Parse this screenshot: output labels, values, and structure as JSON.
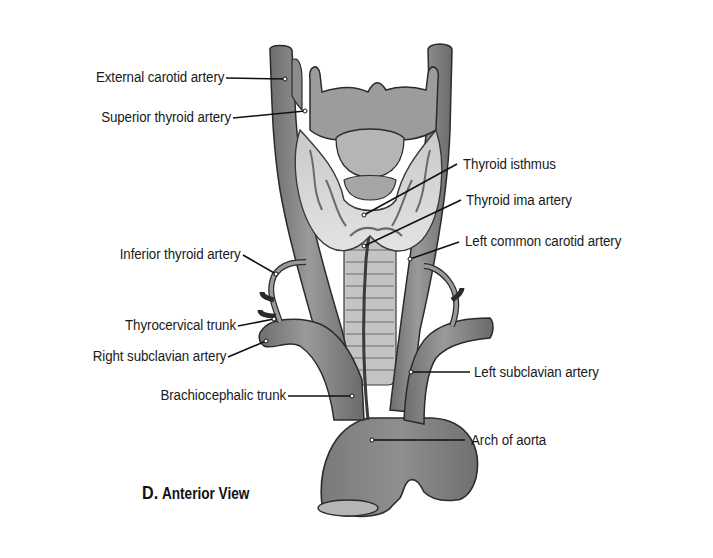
{
  "figure": {
    "panel_letter": "D.",
    "view_title": "Anterior View",
    "colors": {
      "artery": "#8a8a8a",
      "artery_dark": "#5e5e5e",
      "thyroid_gland": "#dcdcdc",
      "cartilage": "#a9a9a9",
      "outline": "#2b2b2b",
      "leader_line": "#111111",
      "background": "#ffffff"
    }
  },
  "labels": {
    "left": [
      {
        "id": "external-carotid-artery",
        "text": "External carotid artery"
      },
      {
        "id": "superior-thyroid-artery",
        "text": "Superior thyroid artery"
      },
      {
        "id": "inferior-thyroid-artery",
        "text": "Inferior thyroid artery"
      },
      {
        "id": "thyrocervical-trunk",
        "text": "Thyrocervical trunk"
      },
      {
        "id": "right-subclavian-artery",
        "text": "Right subclavian artery"
      },
      {
        "id": "brachiocephalic-trunk",
        "text": "Brachiocephalic trunk"
      }
    ],
    "right": [
      {
        "id": "thyroid-isthmus",
        "text": "Thyroid isthmus"
      },
      {
        "id": "thyroid-ima-artery",
        "text": "Thyroid ima artery"
      },
      {
        "id": "left-common-carotid-artery",
        "text": "Left common carotid artery"
      },
      {
        "id": "left-subclavian-artery",
        "text": "Left subclavian artery"
      },
      {
        "id": "arch-of-aorta",
        "text": "Arch of aorta"
      }
    ]
  }
}
